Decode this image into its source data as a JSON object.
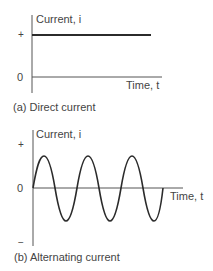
{
  "diagrams": [
    {
      "id": "a",
      "caption": "(a) Direct current",
      "y_axis_label": "Current, i",
      "x_axis_label": "Time, t",
      "y_ticks": [
        "+",
        "0"
      ],
      "waveform": "constant positive (DC)"
    },
    {
      "id": "b",
      "caption": "(b) Alternating current",
      "y_axis_label": "Current, i",
      "x_axis_label": "Time, t",
      "y_ticks": [
        "+",
        "0",
        "−"
      ],
      "waveform": "sinusoid, 3 cycles (AC)"
    }
  ],
  "colors": {
    "line": "#2b2b2b",
    "axis": "#555555",
    "text": "#444444"
  }
}
